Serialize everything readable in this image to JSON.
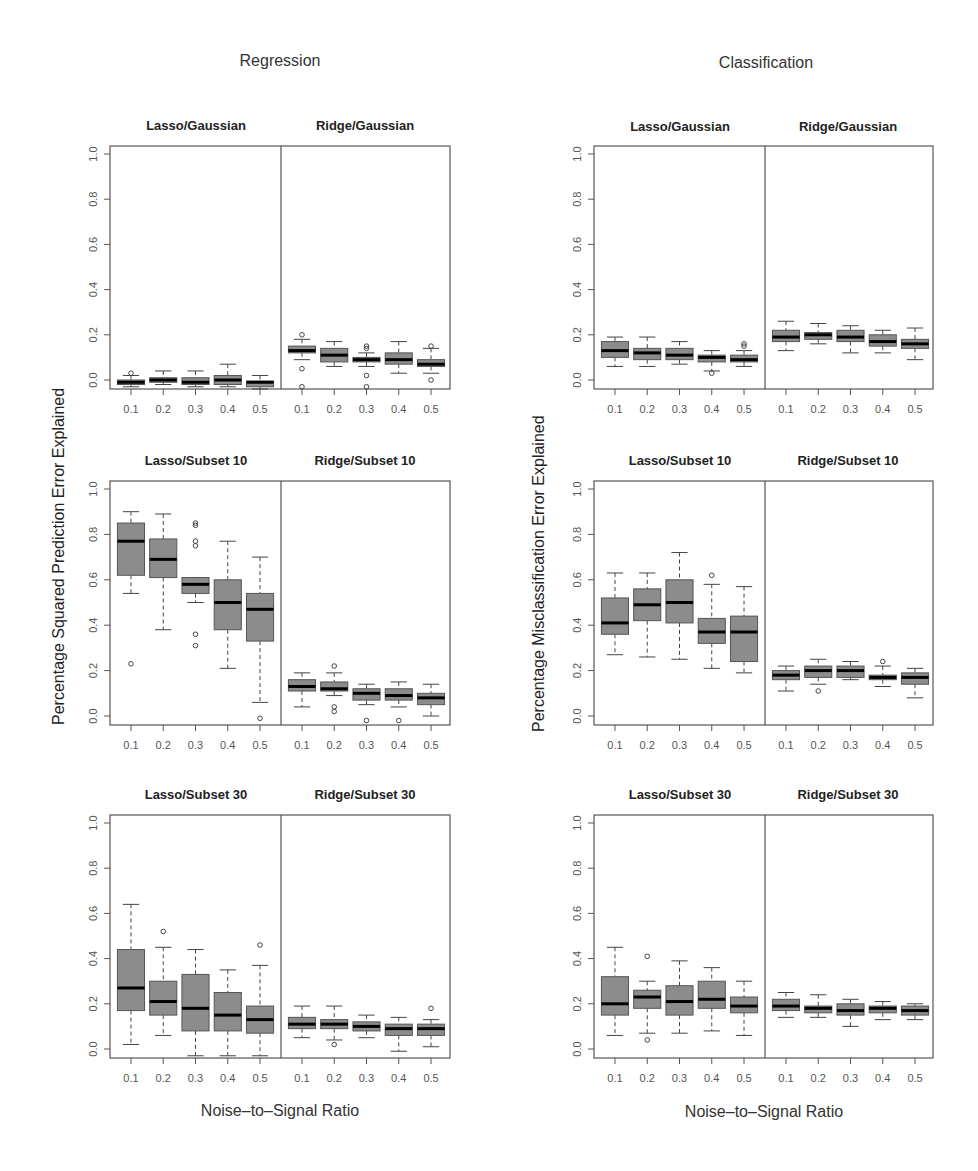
{
  "figure": {
    "col_titles": [
      "Regression",
      "Classification"
    ],
    "ylabels": [
      "Percentage Squared Prediction Error Explained",
      "Percentage Misclassification Error Explained"
    ],
    "xlabel": "Noise–to–Signal Ratio",
    "colors": {
      "box_fill": "#8c8c8c",
      "box_border": "#555555",
      "median": "#000000",
      "frame": "#555555",
      "text": "#333333"
    }
  },
  "chart_data": [
    {
      "type": "boxplot",
      "column": "Regression",
      "row": "Gaussian",
      "panels": [
        "Lasso/Gaussian",
        "Ridge/Gaussian"
      ],
      "ylabel": "Percentage Squared Prediction Error Explained",
      "xlabel": "Noise–to–Signal Ratio",
      "categories": [
        "0.1",
        "0.2",
        "0.3",
        "0.4",
        "0.5"
      ],
      "yticks": [
        "0.0",
        "0.2",
        "0.4",
        "0.6",
        "0.8",
        "1.0"
      ],
      "ylim": [
        0,
        1
      ],
      "series": [
        {
          "name": "Lasso/Gaussian",
          "boxes": [
            {
              "lo": -0.03,
              "q1": -0.02,
              "med": -0.01,
              "q3": 0.0,
              "hi": 0.02,
              "out": [
                0.03
              ]
            },
            {
              "lo": -0.02,
              "q1": -0.01,
              "med": 0.0,
              "q3": 0.01,
              "hi": 0.04,
              "out": []
            },
            {
              "lo": -0.03,
              "q1": -0.02,
              "med": -0.01,
              "q3": 0.01,
              "hi": 0.04,
              "out": []
            },
            {
              "lo": -0.03,
              "q1": -0.02,
              "med": 0.0,
              "q3": 0.02,
              "hi": 0.07,
              "out": []
            },
            {
              "lo": -0.04,
              "q1": -0.03,
              "med": -0.01,
              "q3": -0.005,
              "hi": 0.02,
              "out": []
            }
          ]
        },
        {
          "name": "Ridge/Gaussian",
          "boxes": [
            {
              "lo": 0.09,
              "q1": 0.12,
              "med": 0.13,
              "q3": 0.15,
              "hi": 0.18,
              "out": [
                0.2,
                0.05,
                -0.03
              ]
            },
            {
              "lo": 0.06,
              "q1": 0.08,
              "med": 0.11,
              "q3": 0.14,
              "hi": 0.17,
              "out": []
            },
            {
              "lo": 0.06,
              "q1": 0.08,
              "med": 0.09,
              "q3": 0.1,
              "hi": 0.12,
              "out": [
                0.14,
                0.15,
                0.02,
                -0.03
              ]
            },
            {
              "lo": 0.03,
              "q1": 0.07,
              "med": 0.09,
              "q3": 0.12,
              "hi": 0.17,
              "out": []
            },
            {
              "lo": 0.03,
              "q1": 0.06,
              "med": 0.07,
              "q3": 0.09,
              "hi": 0.14,
              "out": [
                0.15,
                0.0
              ]
            }
          ]
        }
      ]
    },
    {
      "type": "boxplot",
      "column": "Classification",
      "row": "Gaussian",
      "panels": [
        "Lasso/Gaussian",
        "Ridge/Gaussian"
      ],
      "ylabel": "Percentage Misclassification Error Explained",
      "xlabel": "Noise–to–Signal Ratio",
      "categories": [
        "0.1",
        "0.2",
        "0.3",
        "0.4",
        "0.5"
      ],
      "yticks": [
        "0.0",
        "0.2",
        "0.4",
        "0.6",
        "0.8",
        "1.0"
      ],
      "ylim": [
        0,
        1
      ],
      "series": [
        {
          "name": "Lasso/Gaussian",
          "boxes": [
            {
              "lo": 0.06,
              "q1": 0.1,
              "med": 0.13,
              "q3": 0.17,
              "hi": 0.19,
              "out": []
            },
            {
              "lo": 0.06,
              "q1": 0.09,
              "med": 0.12,
              "q3": 0.14,
              "hi": 0.19,
              "out": []
            },
            {
              "lo": 0.07,
              "q1": 0.09,
              "med": 0.11,
              "q3": 0.14,
              "hi": 0.17,
              "out": []
            },
            {
              "lo": 0.04,
              "q1": 0.08,
              "med": 0.1,
              "q3": 0.11,
              "hi": 0.13,
              "out": [
                0.03
              ]
            },
            {
              "lo": 0.06,
              "q1": 0.08,
              "med": 0.09,
              "q3": 0.11,
              "hi": 0.13,
              "out": [
                0.15,
                0.16
              ]
            }
          ]
        },
        {
          "name": "Ridge/Gaussian",
          "boxes": [
            {
              "lo": 0.13,
              "q1": 0.17,
              "med": 0.19,
              "q3": 0.22,
              "hi": 0.26,
              "out": []
            },
            {
              "lo": 0.16,
              "q1": 0.18,
              "med": 0.2,
              "q3": 0.21,
              "hi": 0.25,
              "out": []
            },
            {
              "lo": 0.12,
              "q1": 0.17,
              "med": 0.19,
              "q3": 0.22,
              "hi": 0.24,
              "out": []
            },
            {
              "lo": 0.12,
              "q1": 0.15,
              "med": 0.17,
              "q3": 0.2,
              "hi": 0.22,
              "out": []
            },
            {
              "lo": 0.09,
              "q1": 0.14,
              "med": 0.16,
              "q3": 0.18,
              "hi": 0.23,
              "out": []
            }
          ]
        }
      ]
    },
    {
      "type": "boxplot",
      "column": "Regression",
      "row": "Subset 10",
      "panels": [
        "Lasso/Subset 10",
        "Ridge/Subset 10"
      ],
      "ylabel": "Percentage Squared Prediction Error Explained",
      "xlabel": "Noise–to–Signal Ratio",
      "categories": [
        "0.1",
        "0.2",
        "0.3",
        "0.4",
        "0.5"
      ],
      "yticks": [
        "0.0",
        "0.2",
        "0.4",
        "0.6",
        "0.8",
        "1.0"
      ],
      "ylim": [
        0,
        1
      ],
      "series": [
        {
          "name": "Lasso/Subset 10",
          "boxes": [
            {
              "lo": 0.54,
              "q1": 0.62,
              "med": 0.77,
              "q3": 0.85,
              "hi": 0.9,
              "out": [
                0.23
              ]
            },
            {
              "lo": 0.38,
              "q1": 0.61,
              "med": 0.69,
              "q3": 0.78,
              "hi": 0.89,
              "out": []
            },
            {
              "lo": 0.5,
              "q1": 0.54,
              "med": 0.58,
              "q3": 0.61,
              "hi": 0.61,
              "out": [
                0.84,
                0.85,
                0.77,
                0.75,
                0.36,
                0.31
              ]
            },
            {
              "lo": 0.21,
              "q1": 0.38,
              "med": 0.5,
              "q3": 0.6,
              "hi": 0.77,
              "out": []
            },
            {
              "lo": 0.06,
              "q1": 0.33,
              "med": 0.47,
              "q3": 0.54,
              "hi": 0.7,
              "out": [
                -0.01
              ]
            }
          ]
        },
        {
          "name": "Ridge/Subset 10",
          "boxes": [
            {
              "lo": 0.04,
              "q1": 0.11,
              "med": 0.13,
              "q3": 0.16,
              "hi": 0.19,
              "out": []
            },
            {
              "lo": 0.09,
              "q1": 0.11,
              "med": 0.12,
              "q3": 0.15,
              "hi": 0.19,
              "out": [
                0.22,
                0.04,
                0.02
              ]
            },
            {
              "lo": 0.05,
              "q1": 0.07,
              "med": 0.1,
              "q3": 0.12,
              "hi": 0.14,
              "out": [
                -0.02
              ]
            },
            {
              "lo": 0.04,
              "q1": 0.07,
              "med": 0.09,
              "q3": 0.12,
              "hi": 0.15,
              "out": [
                -0.02
              ]
            },
            {
              "lo": 0.0,
              "q1": 0.05,
              "med": 0.08,
              "q3": 0.1,
              "hi": 0.14,
              "out": []
            }
          ]
        }
      ]
    },
    {
      "type": "boxplot",
      "column": "Classification",
      "row": "Subset 10",
      "panels": [
        "Lasso/Subset 10",
        "Ridge/Subset 10"
      ],
      "ylabel": "Percentage Misclassification Error Explained",
      "xlabel": "Noise–to–Signal Ratio",
      "categories": [
        "0.1",
        "0.2",
        "0.3",
        "0.4",
        "0.5"
      ],
      "yticks": [
        "0.0",
        "0.2",
        "0.4",
        "0.6",
        "0.8",
        "1.0"
      ],
      "ylim": [
        0,
        1
      ],
      "series": [
        {
          "name": "Lasso/Subset 10",
          "boxes": [
            {
              "lo": 0.27,
              "q1": 0.36,
              "med": 0.41,
              "q3": 0.52,
              "hi": 0.63,
              "out": []
            },
            {
              "lo": 0.26,
              "q1": 0.42,
              "med": 0.49,
              "q3": 0.56,
              "hi": 0.63,
              "out": []
            },
            {
              "lo": 0.25,
              "q1": 0.41,
              "med": 0.5,
              "q3": 0.6,
              "hi": 0.72,
              "out": []
            },
            {
              "lo": 0.21,
              "q1": 0.32,
              "med": 0.37,
              "q3": 0.43,
              "hi": 0.58,
              "out": [
                0.62
              ]
            },
            {
              "lo": 0.19,
              "q1": 0.24,
              "med": 0.37,
              "q3": 0.44,
              "hi": 0.57,
              "out": []
            }
          ]
        },
        {
          "name": "Ridge/Subset 10",
          "boxes": [
            {
              "lo": 0.11,
              "q1": 0.16,
              "med": 0.18,
              "q3": 0.2,
              "hi": 0.22,
              "out": []
            },
            {
              "lo": 0.14,
              "q1": 0.17,
              "med": 0.2,
              "q3": 0.22,
              "hi": 0.25,
              "out": [
                0.11
              ]
            },
            {
              "lo": 0.16,
              "q1": 0.17,
              "med": 0.2,
              "q3": 0.22,
              "hi": 0.24,
              "out": []
            },
            {
              "lo": 0.13,
              "q1": 0.16,
              "med": 0.17,
              "q3": 0.18,
              "hi": 0.22,
              "out": [
                0.24
              ]
            },
            {
              "lo": 0.08,
              "q1": 0.14,
              "med": 0.17,
              "q3": 0.19,
              "hi": 0.21,
              "out": []
            }
          ]
        }
      ]
    },
    {
      "type": "boxplot",
      "column": "Regression",
      "row": "Subset 30",
      "panels": [
        "Lasso/Subset 30",
        "Ridge/Subset 30"
      ],
      "ylabel": "Percentage Squared Prediction Error Explained",
      "xlabel": "Noise–to–Signal Ratio",
      "categories": [
        "0.1",
        "0.2",
        "0.3",
        "0.4",
        "0.5"
      ],
      "yticks": [
        "0.0",
        "0.2",
        "0.4",
        "0.6",
        "0.8",
        "1.0"
      ],
      "ylim": [
        0,
        1
      ],
      "series": [
        {
          "name": "Lasso/Subset 30",
          "boxes": [
            {
              "lo": 0.02,
              "q1": 0.17,
              "med": 0.27,
              "q3": 0.44,
              "hi": 0.64,
              "out": []
            },
            {
              "lo": 0.06,
              "q1": 0.15,
              "med": 0.21,
              "q3": 0.3,
              "hi": 0.45,
              "out": [
                0.52
              ]
            },
            {
              "lo": -0.03,
              "q1": 0.08,
              "med": 0.18,
              "q3": 0.33,
              "hi": 0.44,
              "out": []
            },
            {
              "lo": -0.03,
              "q1": 0.08,
              "med": 0.15,
              "q3": 0.25,
              "hi": 0.35,
              "out": []
            },
            {
              "lo": -0.03,
              "q1": 0.07,
              "med": 0.13,
              "q3": 0.19,
              "hi": 0.37,
              "out": [
                0.46
              ]
            }
          ]
        },
        {
          "name": "Ridge/Subset 30",
          "boxes": [
            {
              "lo": 0.05,
              "q1": 0.09,
              "med": 0.11,
              "q3": 0.14,
              "hi": 0.19,
              "out": []
            },
            {
              "lo": 0.04,
              "q1": 0.09,
              "med": 0.11,
              "q3": 0.13,
              "hi": 0.19,
              "out": [
                0.02
              ]
            },
            {
              "lo": 0.05,
              "q1": 0.08,
              "med": 0.1,
              "q3": 0.12,
              "hi": 0.15,
              "out": []
            },
            {
              "lo": -0.01,
              "q1": 0.06,
              "med": 0.09,
              "q3": 0.11,
              "hi": 0.14,
              "out": []
            },
            {
              "lo": 0.01,
              "q1": 0.06,
              "med": 0.09,
              "q3": 0.11,
              "hi": 0.13,
              "out": [
                0.18
              ]
            }
          ]
        }
      ]
    },
    {
      "type": "boxplot",
      "column": "Classification",
      "row": "Subset 30",
      "panels": [
        "Lasso/Subset 30",
        "Ridge/Subset 30"
      ],
      "ylabel": "Percentage Misclassification Error Explained",
      "xlabel": "Noise–to–Signal Ratio",
      "categories": [
        "0.1",
        "0.2",
        "0.3",
        "0.4",
        "0.5"
      ],
      "yticks": [
        "0.0",
        "0.2",
        "0.4",
        "0.6",
        "0.8",
        "1.0"
      ],
      "ylim": [
        0,
        1
      ],
      "series": [
        {
          "name": "Lasso/Subset 30",
          "boxes": [
            {
              "lo": 0.06,
              "q1": 0.15,
              "med": 0.2,
              "q3": 0.32,
              "hi": 0.45,
              "out": []
            },
            {
              "lo": 0.07,
              "q1": 0.18,
              "med": 0.23,
              "q3": 0.26,
              "hi": 0.3,
              "out": [
                0.41,
                0.04
              ]
            },
            {
              "lo": 0.07,
              "q1": 0.15,
              "med": 0.21,
              "q3": 0.28,
              "hi": 0.39,
              "out": []
            },
            {
              "lo": 0.08,
              "q1": 0.18,
              "med": 0.22,
              "q3": 0.3,
              "hi": 0.36,
              "out": []
            },
            {
              "lo": 0.06,
              "q1": 0.16,
              "med": 0.19,
              "q3": 0.23,
              "hi": 0.3,
              "out": []
            }
          ]
        },
        {
          "name": "Ridge/Subset 30",
          "boxes": [
            {
              "lo": 0.14,
              "q1": 0.17,
              "med": 0.19,
              "q3": 0.22,
              "hi": 0.25,
              "out": []
            },
            {
              "lo": 0.14,
              "q1": 0.16,
              "med": 0.18,
              "q3": 0.19,
              "hi": 0.24,
              "out": []
            },
            {
              "lo": 0.1,
              "q1": 0.15,
              "med": 0.17,
              "q3": 0.2,
              "hi": 0.22,
              "out": []
            },
            {
              "lo": 0.13,
              "q1": 0.16,
              "med": 0.18,
              "q3": 0.19,
              "hi": 0.21,
              "out": []
            },
            {
              "lo": 0.13,
              "q1": 0.15,
              "med": 0.17,
              "q3": 0.19,
              "hi": 0.2,
              "out": []
            }
          ]
        }
      ]
    }
  ]
}
